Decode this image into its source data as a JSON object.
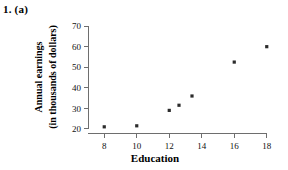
{
  "figure": {
    "problem_label": "1. (a)"
  },
  "chart_data": {
    "type": "scatter",
    "title": "",
    "xlabel": "Education",
    "ylabel": "Annual earnings (in thousands of dollars)",
    "ylabel_line_1": "Annual earnings",
    "ylabel_line_2": "(in thousands of dollars)",
    "xlim": [
      7,
      19
    ],
    "ylim": [
      18,
      72
    ],
    "xticks": [
      8,
      10,
      12,
      14,
      16,
      18
    ],
    "xtick_labels": [
      "8",
      "10",
      "12",
      "14",
      "16",
      "18"
    ],
    "yticks": [
      20,
      30,
      40,
      50,
      60,
      70
    ],
    "ytick_labels": [
      "20",
      "30",
      "40",
      "50",
      "60",
      "70"
    ],
    "grid": false,
    "legend": false,
    "marker": "square",
    "marker_color": "#2b2b2b",
    "points": [
      {
        "x": 8,
        "y": 21
      },
      {
        "x": 10,
        "y": 21.5
      },
      {
        "x": 12,
        "y": 29
      },
      {
        "x": 12.6,
        "y": 31.5
      },
      {
        "x": 13.4,
        "y": 36
      },
      {
        "x": 16,
        "y": 52.5
      },
      {
        "x": 18,
        "y": 60
      }
    ]
  }
}
